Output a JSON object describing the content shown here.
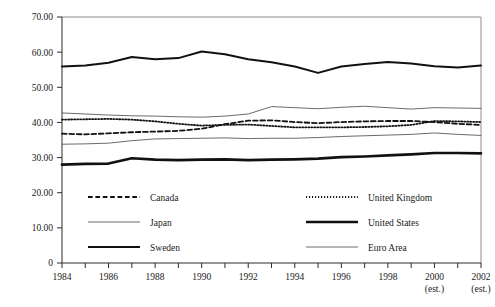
{
  "chart_data": {
    "type": "line",
    "title": "",
    "subtitle": "",
    "xlabel": "",
    "ylabel": "",
    "xlim": [
      1984,
      2002
    ],
    "ylim": [
      0,
      70
    ],
    "yticks": [
      0,
      10,
      20,
      30,
      40,
      50,
      60,
      70
    ],
    "ytick_labels": [
      "0",
      "10.00",
      "20.00",
      "30.00",
      "40.00",
      "50.00",
      "60.00",
      "70.00"
    ],
    "x": [
      1984,
      1985,
      1986,
      1987,
      1988,
      1989,
      1990,
      1991,
      1992,
      1993,
      1994,
      1995,
      1996,
      1997,
      1998,
      1999,
      2000,
      2001,
      2002
    ],
    "xtick_labels": [
      "1984",
      "",
      "1986",
      "",
      "1988",
      "",
      "1990",
      "",
      "1992",
      "",
      "1994",
      "",
      "1996",
      "",
      "1998",
      "",
      "2000",
      "",
      "2002"
    ],
    "xtick_sublabels": [
      "",
      "",
      "",
      "",
      "",
      "",
      "",
      "",
      "",
      "",
      "",
      "",
      "",
      "",
      "",
      "",
      "(est.)",
      "",
      "(est.)"
    ],
    "grid": false,
    "legend_position": "below-axes",
    "series": [
      {
        "name": "Canada",
        "style": "dashed",
        "color": "#111111",
        "width": 1.8,
        "values": [
          36.8,
          36.6,
          36.9,
          37.2,
          37.4,
          37.6,
          38.2,
          39.5,
          40.5,
          40.6,
          40.1,
          39.8,
          40.1,
          40.3,
          40.4,
          40.4,
          40.1,
          39.6,
          39.3
        ]
      },
      {
        "name": "United Kingdom",
        "style": "dotted",
        "color": "#111111",
        "width": 1.8,
        "values": [
          40.8,
          40.9,
          41.0,
          40.8,
          40.3,
          39.6,
          39.1,
          39.3,
          39.4,
          39.0,
          38.6,
          38.6,
          38.6,
          38.7,
          38.9,
          39.3,
          40.4,
          40.3,
          40.1
        ]
      },
      {
        "name": "Japan",
        "style": "solid-thin",
        "color": "#6a6a6a",
        "width": 1.0,
        "values": [
          42.7,
          42.4,
          42.1,
          41.9,
          41.8,
          41.6,
          41.5,
          41.8,
          42.4,
          44.5,
          44.2,
          43.9,
          44.3,
          44.6,
          44.2,
          43.8,
          44.2,
          44.1,
          44.0
        ]
      },
      {
        "name": "United States",
        "style": "solid-bold",
        "color": "#111111",
        "width": 2.7,
        "values": [
          28.0,
          28.2,
          28.3,
          29.8,
          29.4,
          29.3,
          29.4,
          29.5,
          29.3,
          29.4,
          29.5,
          29.7,
          30.1,
          30.3,
          30.6,
          30.9,
          31.3,
          31.3,
          31.2
        ]
      },
      {
        "name": "Sweden",
        "style": "solid-medium",
        "color": "#111111",
        "width": 2.0,
        "values": [
          55.9,
          56.2,
          57.0,
          58.6,
          58.0,
          58.3,
          60.2,
          59.4,
          58.0,
          57.1,
          55.9,
          54.1,
          55.9,
          56.6,
          57.2,
          56.8,
          56.0,
          55.6,
          56.2
        ]
      },
      {
        "name": "Euro Area",
        "style": "solid-thin",
        "color": "#6a6a6a",
        "width": 1.0,
        "values": [
          33.8,
          33.9,
          34.1,
          34.8,
          35.3,
          35.4,
          35.5,
          35.6,
          35.4,
          35.5,
          35.5,
          35.7,
          36.0,
          36.2,
          36.4,
          36.6,
          37.0,
          36.6,
          36.3
        ]
      }
    ],
    "legend_entries": [
      {
        "label": "Canada",
        "style": "dashed",
        "col": 0,
        "row": 0
      },
      {
        "label": "United Kingdom",
        "style": "dotted",
        "col": 1,
        "row": 0
      },
      {
        "label": "Japan",
        "style": "solid-thin",
        "col": 0,
        "row": 1
      },
      {
        "label": "United States",
        "style": "solid-bold",
        "col": 1,
        "row": 1
      },
      {
        "label": "Sweden",
        "style": "solid-medium",
        "col": 0,
        "row": 2
      },
      {
        "label": "Euro Area",
        "style": "solid-thin",
        "col": 1,
        "row": 2
      }
    ]
  },
  "colors": {
    "background": "#ffffff",
    "axis": "#2b2b2b",
    "frame": "#8d8d8d",
    "dark_series": "#111111",
    "light_series": "#6a6a6a"
  }
}
